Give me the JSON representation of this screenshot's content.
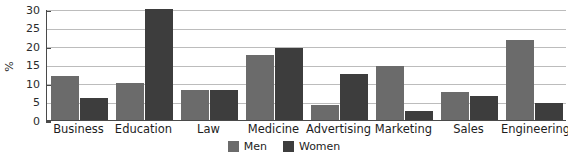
{
  "chart_data": {
    "type": "bar",
    "title": "",
    "subtitle": "",
    "xlabel": "",
    "ylabel": "%",
    "ylim": [
      0,
      30
    ],
    "yticks": [
      0,
      5,
      10,
      15,
      20,
      25,
      30
    ],
    "ytick_labels": [
      "0",
      "5",
      "10",
      "15",
      "20",
      "25",
      "30"
    ],
    "grid": true,
    "legend_position": "bottom-center",
    "categories": [
      "Business",
      "Education",
      "Law",
      "Medicine",
      "Advertising",
      "Marketing",
      "Sales",
      "Engineering"
    ],
    "series": [
      {
        "name": "Men",
        "color": "#6b6b6b",
        "values": [
          12,
          10,
          8,
          17.5,
          4,
          14.5,
          7.5,
          21.5
        ]
      },
      {
        "name": "Women",
        "color": "#3d3d3d",
        "values": [
          6,
          30,
          8,
          19.5,
          12.5,
          2.5,
          6.5,
          4.5
        ]
      }
    ]
  },
  "legend": {
    "items": [
      {
        "label": "Men",
        "series": "men"
      },
      {
        "label": "Women",
        "series": "women"
      }
    ]
  }
}
